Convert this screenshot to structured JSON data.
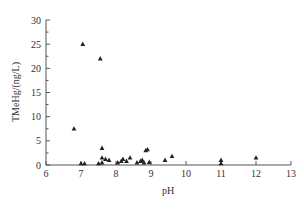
{
  "chart_data": {
    "type": "scatter",
    "title": "",
    "xlabel": "pH",
    "ylabel": "TMeHg/(ng/L)",
    "xlim": [
      6,
      13
    ],
    "ylim": [
      0,
      30
    ],
    "xticks": [
      6,
      7,
      8,
      9,
      10,
      11,
      12,
      13
    ],
    "yticks": [
      0,
      5,
      10,
      15,
      20,
      25,
      30
    ],
    "grid": false,
    "legend": null,
    "marker": "triangle",
    "series": [
      {
        "name": "TMeHg",
        "points": [
          {
            "x": 6.8,
            "y": 7.5
          },
          {
            "x": 7.0,
            "y": 0.3
          },
          {
            "x": 7.05,
            "y": 25.0
          },
          {
            "x": 7.1,
            "y": 0.3
          },
          {
            "x": 7.5,
            "y": 0.3
          },
          {
            "x": 7.55,
            "y": 22.0
          },
          {
            "x": 7.6,
            "y": 0.5
          },
          {
            "x": 7.6,
            "y": 3.5
          },
          {
            "x": 7.6,
            "y": 1.5
          },
          {
            "x": 7.7,
            "y": 1.2
          },
          {
            "x": 7.8,
            "y": 1.0
          },
          {
            "x": 8.05,
            "y": 0.5
          },
          {
            "x": 8.15,
            "y": 0.8
          },
          {
            "x": 8.2,
            "y": 1.2
          },
          {
            "x": 8.3,
            "y": 0.8
          },
          {
            "x": 8.4,
            "y": 1.5
          },
          {
            "x": 8.6,
            "y": 0.5
          },
          {
            "x": 8.7,
            "y": 0.8
          },
          {
            "x": 8.75,
            "y": 1.0
          },
          {
            "x": 8.8,
            "y": 0.5
          },
          {
            "x": 8.85,
            "y": 3.0
          },
          {
            "x": 8.9,
            "y": 3.2
          },
          {
            "x": 8.95,
            "y": 0.6
          },
          {
            "x": 9.4,
            "y": 1.0
          },
          {
            "x": 9.6,
            "y": 1.8
          },
          {
            "x": 11.0,
            "y": 0.3
          },
          {
            "x": 11.0,
            "y": 1.0
          },
          {
            "x": 12.0,
            "y": 1.5
          }
        ]
      }
    ]
  }
}
